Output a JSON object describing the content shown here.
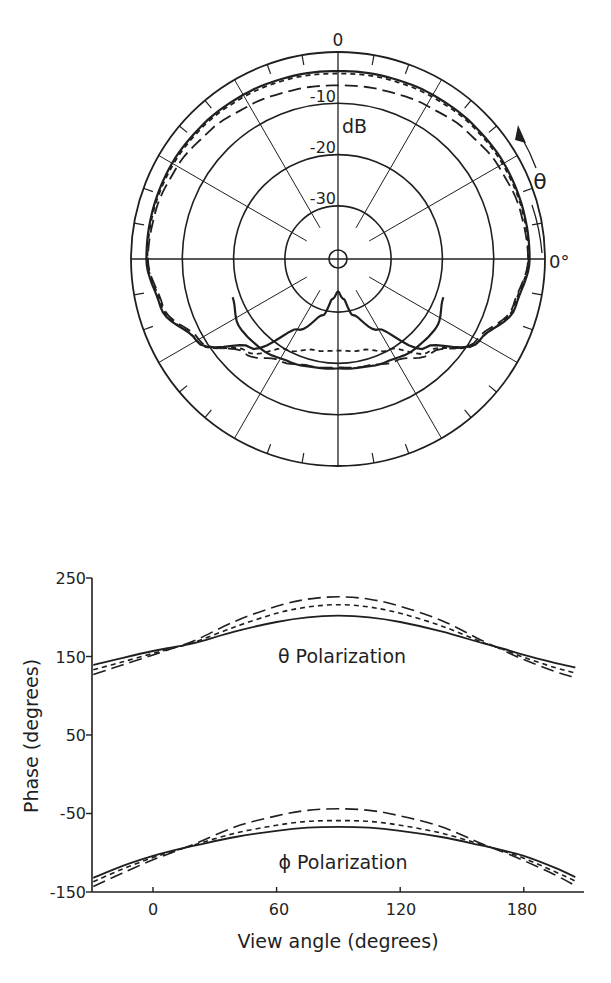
{
  "chart_data": [
    {
      "type": "polar",
      "title": "",
      "radial_unit_label": "dB",
      "radial_ticks": [
        0,
        -10,
        -20,
        -30
      ],
      "radial_tick_labels": [
        "0",
        "-10",
        "-20",
        "-30"
      ],
      "radial_range_db": [
        -40,
        0
      ],
      "angle_label": "θ",
      "angle_zero_label": "0°",
      "angle_direction": "counterclockwise from right (3 o'clock)",
      "spoke_spacing_deg": 30,
      "outer_tick_spacing_deg": 10,
      "series": [
        {
          "name": "solid",
          "style": "solid",
          "angles_deg": [
            0,
            15,
            30,
            45,
            60,
            75,
            90,
            105,
            120,
            135,
            150,
            165,
            180,
            195,
            210,
            225,
            240,
            255,
            262,
            270,
            278,
            285,
            300,
            315,
            330,
            345,
            360
          ],
          "values_db": [
            -3.0,
            -3.0,
            -3.0,
            -3.2,
            -3.4,
            -3.6,
            -3.7,
            -3.6,
            -3.4,
            -3.2,
            -3.0,
            -3.0,
            -3.0,
            -4.5,
            -8.5,
            -16.0,
            -24.5,
            -29.0,
            -32.5,
            -34.0,
            -32.5,
            -29.0,
            -24.5,
            -16.0,
            -8.5,
            -4.5,
            -3.0
          ]
        },
        {
          "name": "short-dash",
          "style": "short-dash",
          "angles_deg": [
            0,
            15,
            30,
            45,
            60,
            75,
            90,
            105,
            120,
            135,
            150,
            165,
            180,
            195,
            210,
            225,
            240,
            255,
            270,
            285,
            300,
            315,
            330,
            345,
            360
          ],
          "values_db": [
            -3.2,
            -3.2,
            -3.3,
            -3.5,
            -3.8,
            -4.0,
            -4.2,
            -4.0,
            -3.8,
            -3.5,
            -3.3,
            -3.2,
            -3.2,
            -4.8,
            -8.5,
            -15.0,
            -20.0,
            -22.0,
            -22.5,
            -22.0,
            -20.0,
            -15.0,
            -8.5,
            -4.8,
            -3.2
          ]
        },
        {
          "name": "long-dash",
          "style": "long-dash",
          "angles_deg": [
            0,
            15,
            30,
            45,
            60,
            75,
            90,
            105,
            120,
            135,
            150,
            165,
            180,
            195,
            210,
            225,
            240,
            255,
            270,
            285,
            300,
            315,
            330,
            345,
            360
          ],
          "values_db": [
            -3.3,
            -3.6,
            -4.2,
            -5.0,
            -5.8,
            -6.3,
            -6.5,
            -6.3,
            -5.8,
            -5.0,
            -4.2,
            -3.6,
            -3.3,
            -5.0,
            -9.0,
            -14.5,
            -17.5,
            -18.8,
            -19.2,
            -18.8,
            -17.5,
            -14.5,
            -9.0,
            -5.0,
            -3.3
          ]
        },
        {
          "name": "solid-lower-lobe",
          "style": "solid",
          "angles_deg": [
            200,
            215,
            230,
            245,
            260,
            270,
            280,
            295,
            310,
            325,
            340
          ],
          "values_db": [
            -18.5,
            -17.0,
            -17.3,
            -18.2,
            -18.8,
            -19.0,
            -18.8,
            -18.2,
            -17.3,
            -17.0,
            -18.5
          ]
        }
      ]
    },
    {
      "type": "line",
      "title": "",
      "xlabel": "View angle (degrees)",
      "ylabel": "Phase (degrees)",
      "xlim": [
        -29,
        205
      ],
      "ylim": [
        -150,
        250
      ],
      "xticks": [
        0,
        60,
        120,
        180
      ],
      "yticks": [
        250,
        150,
        50,
        -50,
        -150
      ],
      "grid": false,
      "annotations": [
        "θ Polarization",
        "ϕ Polarization"
      ],
      "x": [
        -29,
        -15,
        0,
        10,
        20,
        40,
        60,
        75,
        90,
        105,
        120,
        140,
        160,
        170,
        180,
        195,
        205
      ],
      "series": [
        {
          "name": "θ solid",
          "group": "θ Polarization",
          "style": "solid",
          "values": [
            139,
            148,
            157,
            162,
            167,
            182,
            194,
            200,
            202,
            200,
            194,
            182,
            167,
            160,
            152,
            142,
            136
          ]
        },
        {
          "name": "θ short-dash",
          "group": "θ Polarization",
          "style": "short-dash",
          "values": [
            133,
            143,
            154,
            161,
            168,
            188,
            205,
            213,
            216,
            213,
            205,
            189,
            168,
            159,
            149,
            136,
            129
          ]
        },
        {
          "name": "θ long-dash",
          "group": "θ Polarization",
          "style": "long-dash",
          "values": [
            127,
            139,
            152,
            161,
            170,
            195,
            214,
            223,
            226,
            223,
            214,
            196,
            170,
            158,
            146,
            131,
            123
          ]
        },
        {
          "name": "ϕ solid",
          "group": "ϕ Polarization",
          "style": "solid",
          "values": [
            -132,
            -117,
            -104,
            -97,
            -91,
            -80,
            -72,
            -68,
            -67,
            -68,
            -72,
            -80,
            -91,
            -97,
            -104,
            -119,
            -131
          ]
        },
        {
          "name": "ϕ short-dash",
          "group": "ϕ Polarization",
          "style": "short-dash",
          "values": [
            -137,
            -121,
            -106,
            -98,
            -90,
            -75,
            -65,
            -60,
            -59,
            -60,
            -65,
            -75,
            -90,
            -98,
            -107,
            -124,
            -136
          ]
        },
        {
          "name": "ϕ long-dash",
          "group": "ϕ Polarization",
          "style": "long-dash",
          "values": [
            -143,
            -126,
            -109,
            -99,
            -89,
            -67,
            -53,
            -46,
            -44,
            -46,
            -53,
            -67,
            -89,
            -99,
            -110,
            -128,
            -142
          ]
        }
      ]
    }
  ],
  "labels": {
    "polar_zero": "0",
    "polar_m10": "-10",
    "polar_m20": "-20",
    "polar_m30": "-30",
    "polar_unit": "dB",
    "theta_symbol": "θ",
    "angle_zero": "0°",
    "theta_annotation": "θ Polarization",
    "phi_annotation": "ϕ Polarization",
    "xlabel": "View angle (degrees)",
    "ylabel": "Phase (degrees)",
    "ytick_250": "250",
    "ytick_150": "150",
    "ytick_50": "50",
    "ytick_m50": "-50",
    "ytick_m150": "-150",
    "xtick_0": "0",
    "xtick_60": "60",
    "xtick_120": "120",
    "xtick_180": "180"
  }
}
